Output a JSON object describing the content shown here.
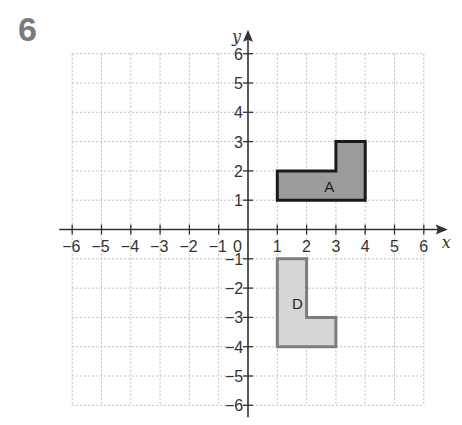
{
  "question_number": "6",
  "grid": {
    "x_min": -6,
    "x_max": 6,
    "y_min": -6,
    "y_max": 6,
    "origin_px": [
      248,
      229.5
    ],
    "unit_px": 29.3,
    "gridline_color": "#bdbdbd",
    "axis_color": "#333333"
  },
  "axes": {
    "x_label": "x",
    "y_label": "y",
    "origin_label": "0",
    "x_ticks": [
      "-6",
      "-5",
      "-4",
      "-3",
      "-2",
      "-1",
      "1",
      "2",
      "3",
      "4",
      "5",
      "6"
    ],
    "y_ticks": [
      "6",
      "5",
      "4",
      "3",
      "2",
      "1",
      "-1",
      "-2",
      "-3",
      "-4",
      "-5",
      "-6"
    ]
  },
  "shapes": [
    {
      "label": "A",
      "vertices": [
        [
          1,
          1
        ],
        [
          4,
          1
        ],
        [
          4,
          3
        ],
        [
          3,
          3
        ],
        [
          3,
          2
        ],
        [
          1,
          2
        ]
      ],
      "fill": "#9b9b9b",
      "stroke": "#1a1a1a",
      "label_pos": [
        2.6,
        1.45
      ]
    },
    {
      "label": "D",
      "vertices": [
        [
          1,
          -1
        ],
        [
          2,
          -1
        ],
        [
          2,
          -3
        ],
        [
          3,
          -3
        ],
        [
          3,
          -4
        ],
        [
          1,
          -4
        ]
      ],
      "fill": "#d6d6d6",
      "stroke": "#7d7d7d",
      "label_pos": [
        1.5,
        -2.55
      ]
    }
  ]
}
